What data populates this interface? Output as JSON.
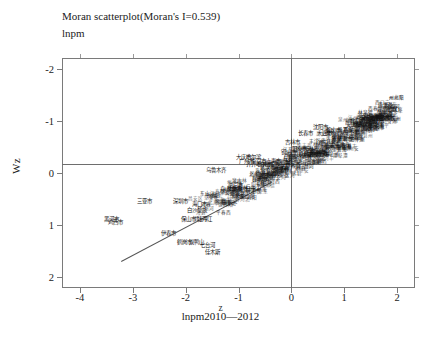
{
  "chart": {
    "title": "Moran scatterplot(Moran's I=0.539)",
    "subtitle": "lnpm",
    "xlabel": "z",
    "ylabel": "Wz",
    "caption": "lnpm2010—2012"
  },
  "axes": {
    "xticks": [
      "-4",
      "-3",
      "-2",
      "-1",
      "0",
      "1",
      "2"
    ],
    "yticks": [
      "2",
      "1",
      "0",
      "-1",
      "-2"
    ]
  },
  "chart_data": {
    "type": "scatter",
    "title": "Moran scatterplot(Moran's I=0.539)",
    "subtitle": "lnpm",
    "caption": "lnpm2010—2012",
    "xlabel": "z",
    "ylabel": "Wz",
    "xlim": [
      -4.34,
      2.34
    ],
    "ylim": [
      -2.21,
      2.21
    ],
    "xticks": [
      -4,
      -3,
      -2,
      -1,
      0,
      1,
      2
    ],
    "yticks": [
      -2,
      -1,
      0,
      1,
      2
    ],
    "grid": false,
    "legend": null,
    "morans_i": 0.539,
    "reference_lines": [
      {
        "orientation": "vertical",
        "x": 0
      },
      {
        "orientation": "horizontal",
        "y": 0.17
      }
    ],
    "fit_line": {
      "x0": -3.22,
      "y0": -1.69,
      "x1": -0.38,
      "y1": -0.17,
      "slope": 0.539
    },
    "point_label_type": "city-name",
    "points": [
      {
        "label": "三亚市",
        "x": -2.77,
        "y": -0.53
      },
      {
        "label": "深圳市",
        "x": -2.09,
        "y": -0.53
      },
      {
        "label": "海口市",
        "x": -1.73,
        "y": -0.59
      },
      {
        "label": "黑河市",
        "x": -3.4,
        "y": -0.88
      },
      {
        "label": "鸡西市",
        "x": -3.33,
        "y": -0.94
      },
      {
        "label": "白沙黎族",
        "x": -1.79,
        "y": -0.72
      },
      {
        "label": "保山市",
        "x": -1.94,
        "y": -0.88
      },
      {
        "label": "牡丹江",
        "x": -1.64,
        "y": -0.88
      },
      {
        "label": "伊春市",
        "x": -2.33,
        "y": -1.15
      },
      {
        "label": "鹤岗市",
        "x": -2.02,
        "y": -1.33
      },
      {
        "label": "双鸭山",
        "x": -1.79,
        "y": -1.33
      },
      {
        "label": "七台河",
        "x": -1.58,
        "y": -1.39
      },
      {
        "label": "佳木斯",
        "x": -1.49,
        "y": -1.51
      },
      {
        "label": "乌鲁木齐",
        "x": -1.43,
        "y": 0.06
      },
      {
        "label": "大庆市",
        "x": -0.91,
        "y": 0.3
      },
      {
        "label": "哈尔滨",
        "x": -0.72,
        "y": 0.3
      },
      {
        "label": "齐齐哈尔",
        "x": -0.66,
        "y": 0.18
      },
      {
        "label": "长春市",
        "x": 0.26,
        "y": 0.76
      },
      {
        "label": "吉林市",
        "x": 0.03,
        "y": 0.59
      },
      {
        "label": "沈阳市",
        "x": 0.56,
        "y": 0.88
      },
      {
        "label": "大连市",
        "x": 0.62,
        "y": 0.76
      },
      {
        "label": "鞍山市",
        "x": 0.79,
        "y": 0.82
      },
      {
        "label": "石家庄",
        "x": 1.11,
        "y": 0.82
      },
      {
        "label": "北京市",
        "x": 1.25,
        "y": 1.0
      },
      {
        "label": "天津市",
        "x": 1.33,
        "y": 0.94
      },
      {
        "label": "保定市",
        "x": 1.45,
        "y": 1.06
      },
      {
        "label": "廊坊市",
        "x": 1.54,
        "y": 1.06
      },
      {
        "label": "唐山市",
        "x": 1.62,
        "y": 1.0
      },
      {
        "label": "邢台市",
        "x": 1.71,
        "y": 1.06
      },
      {
        "label": "邯郸市",
        "x": 1.8,
        "y": 1.06
      },
      {
        "label": "衡水市",
        "x": 1.62,
        "y": 0.88
      },
      {
        "label": "济南市",
        "x": 1.0,
        "y": 0.65
      },
      {
        "label": "青岛市",
        "x": 0.88,
        "y": 0.53
      },
      {
        "label": "阳泉市",
        "x": 0.15,
        "y": 0.47
      },
      {
        "label": "铜川市",
        "x": -0.06,
        "y": 0.41
      },
      {
        "label": "上海市",
        "x": -0.34,
        "y": 0.24
      },
      {
        "label": "杭州市",
        "x": -0.51,
        "y": 0.18
      },
      {
        "label": "广州市",
        "x": -0.85,
        "y": 0.24
      },
      {
        "label": "南京市",
        "x": -0.63,
        "y": 0.24
      },
      {
        "label": "武汉市",
        "x": -0.45,
        "y": 0.12
      },
      {
        "label": "厦门市",
        "x": -1.06,
        "y": -0.24
      },
      {
        "label": "舟山市",
        "x": -1.2,
        "y": -0.3
      },
      {
        "label": "丽江市",
        "x": -0.74,
        "y": -0.35
      },
      {
        "label": "昆明市",
        "x": -0.6,
        "y": -0.12
      },
      {
        "label": "贵阳市",
        "x": -0.48,
        "y": -0.06
      },
      {
        "label": "重庆市",
        "x": -0.28,
        "y": 0.0
      },
      {
        "label": "成都市",
        "x": -0.2,
        "y": 0.06
      },
      {
        "label": "西安市",
        "x": 0.03,
        "y": 0.18
      },
      {
        "label": "郑州市",
        "x": 0.5,
        "y": 0.41
      },
      {
        "label": "太原市",
        "x": 0.35,
        "y": 0.35
      }
    ],
    "cloud_note": "Approximately 280 overlapping Chinese city-name labels form a dense positively-sloped band from lower-left to upper-right; individual labels are mostly illegible at this resolution."
  }
}
